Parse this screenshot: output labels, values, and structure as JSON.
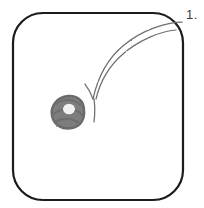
{
  "figure": {
    "panel_label": "1.",
    "background_color": "#ffffff",
    "frame": {
      "name": "rounded-square-frame",
      "stroke_color": "#1a1a1a",
      "stroke_width": 2.2,
      "fill_color": "#ffffff",
      "x": 13,
      "y": 13,
      "width": 170,
      "height": 187,
      "corner_radius": 30
    },
    "arc": {
      "name": "double-line-arc",
      "stroke_color": "#6e6e6e",
      "stroke_width": 1.3,
      "description": "two thin parallel curved lines sweeping from the upper-right frame edge down and to the left, terminating in a small Y fork",
      "fork_tip_x": 93,
      "fork_tip_y": 100
    },
    "blob": {
      "name": "gray-scribble-blob",
      "fill_color": "#7d7d7d",
      "edge_color": "#6a6a6a",
      "hole_color": "#f2f2f2",
      "center_x": 68,
      "center_y": 112,
      "diameter": 31,
      "hole_diameter": 11
    }
  }
}
